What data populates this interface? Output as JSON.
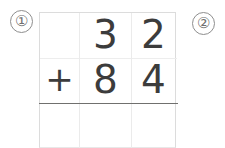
{
  "markers": {
    "left": "①",
    "right": "②"
  },
  "problem": {
    "operator": "+",
    "addend1": {
      "tens": "3",
      "ones": "2"
    },
    "addend2": {
      "tens": "8",
      "ones": "4"
    },
    "sum": {
      "sign": "",
      "tens": "",
      "ones": ""
    }
  },
  "colors": {
    "digit": "#3c3c3c",
    "grid_line": "#dcdcdc",
    "inner_line": "#ebebeb",
    "sum_rule": "#70706e",
    "marker": "#6f6f6f",
    "background": "#ffffff"
  }
}
